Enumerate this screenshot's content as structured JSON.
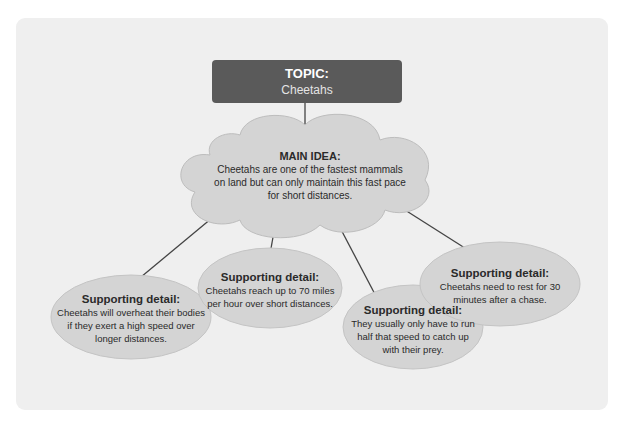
{
  "topic": {
    "label": "TOPIC:",
    "value": "Cheetahs"
  },
  "main_idea": {
    "label": "MAIN IDEA:",
    "lines": [
      "Cheetahs are one of the fastest mammals",
      "on land but can only maintain this fast pace",
      "for short distances."
    ]
  },
  "supporting_details": [
    {
      "label": "Supporting detail:",
      "lines": [
        "Cheetahs will overheat their bodies",
        "if they exert a high speed over",
        "longer distances."
      ]
    },
    {
      "label": "Supporting detail:",
      "lines": [
        "Cheetahs reach up to 70 miles",
        "per hour over short distances."
      ]
    },
    {
      "label": "Supporting detail:",
      "lines": [
        "They usually only have to run",
        "half that speed to catch up",
        "with their prey."
      ]
    },
    {
      "label": "Supporting detail:",
      "lines": [
        "Cheetahs need to rest for 30",
        "minutes after a chase."
      ]
    }
  ],
  "colors": {
    "topic_box": "#5a5a5a",
    "bubble_fill": "#d4d4d4",
    "panel": "#efefef",
    "lines": "#444444"
  }
}
